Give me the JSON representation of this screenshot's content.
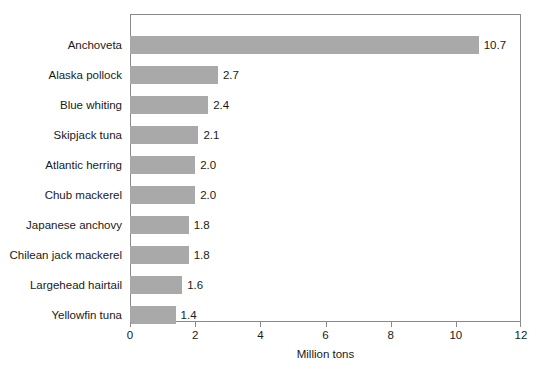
{
  "chart_data": {
    "type": "bar",
    "orientation": "horizontal",
    "title": "",
    "xlabel": "Million tons",
    "ylabel": "",
    "xlim": [
      0,
      12
    ],
    "xticks": [
      0,
      2,
      4,
      6,
      8,
      10,
      12
    ],
    "xtick_labels": [
      "0",
      "2",
      "4",
      "6",
      "8",
      "10",
      "12"
    ],
    "grid": false,
    "legend": null,
    "bar_color": "#a9a9a9",
    "frame_color": "#8a8a8a",
    "categories": [
      "Anchoveta",
      "Alaska pollock",
      "Blue whiting",
      "Skipjack tuna",
      "Atlantic herring",
      "Chub mackerel",
      "Japanese anchovy",
      "Chilean jack mackerel",
      "Largehead hairtail",
      "Yellowfin tuna"
    ],
    "values": [
      10.7,
      2.7,
      2.4,
      2.1,
      2.0,
      2.0,
      1.8,
      1.8,
      1.6,
      1.4
    ],
    "value_labels": [
      "10.7",
      "2.7",
      "2.4",
      "2.1",
      "2.0",
      "2.0",
      "1.8",
      "1.8",
      "1.6",
      "1.4"
    ]
  },
  "caption": {
    "sliver_text": ""
  }
}
